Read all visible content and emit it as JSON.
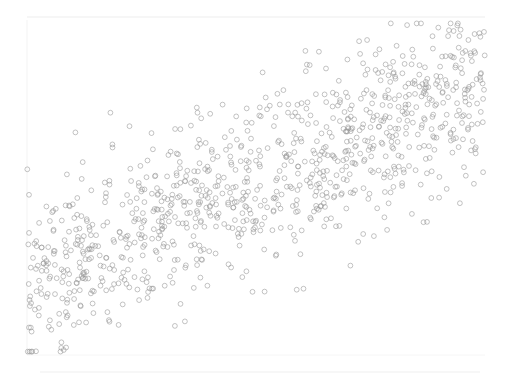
{
  "chart_data": {
    "type": "scatter",
    "title": "",
    "xlabel": "",
    "ylabel": "",
    "grid": false,
    "legend": null,
    "xlim": [
      0,
      100
    ],
    "ylim": [
      0,
      100
    ],
    "marker": {
      "shape": "circle",
      "filled": false,
      "radius": 2.4,
      "stroke": "#9a9a9a",
      "stroke_opacity": 0.75
    },
    "trend": {
      "slope": 0.62,
      "intercept": 20,
      "noise_sd": 13
    },
    "n_points": 1000,
    "sample_points": [
      {
        "x": 1,
        "y": 7
      },
      {
        "x": 3,
        "y": 20
      },
      {
        "x": 2,
        "y": 34
      },
      {
        "x": 5,
        "y": 40
      },
      {
        "x": 8,
        "y": 25
      },
      {
        "x": 10,
        "y": 45
      },
      {
        "x": 14,
        "y": 29
      },
      {
        "x": 20,
        "y": 9
      },
      {
        "x": 18,
        "y": 52
      },
      {
        "x": 25,
        "y": 38
      },
      {
        "x": 30,
        "y": 47
      },
      {
        "x": 35,
        "y": 55
      },
      {
        "x": 40,
        "y": 72
      },
      {
        "x": 45,
        "y": 50
      },
      {
        "x": 50,
        "y": 58
      },
      {
        "x": 55,
        "y": 64
      },
      {
        "x": 60,
        "y": 70
      },
      {
        "x": 65,
        "y": 60
      },
      {
        "x": 70,
        "y": 77
      },
      {
        "x": 75,
        "y": 68
      },
      {
        "x": 80,
        "y": 84
      },
      {
        "x": 85,
        "y": 74
      },
      {
        "x": 90,
        "y": 80
      },
      {
        "x": 95,
        "y": 88
      },
      {
        "x": 99,
        "y": 95
      },
      {
        "x": 98,
        "y": 62
      }
    ]
  },
  "plot_area": {
    "left": 27,
    "top": 20,
    "right": 485,
    "bottom": 355
  },
  "faint_labels": {
    "top": "",
    "bottom": ""
  }
}
